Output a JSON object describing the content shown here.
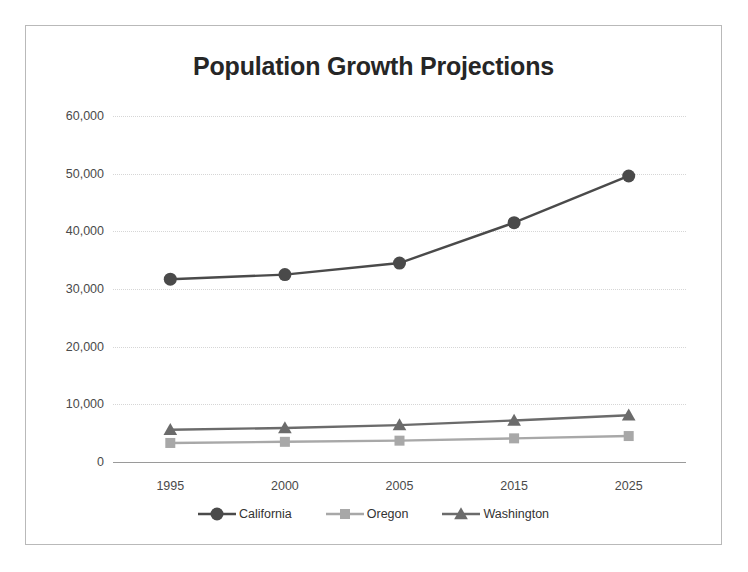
{
  "chart_data": {
    "type": "line",
    "title": "Population Growth Projections",
    "xlabel": "",
    "ylabel": "",
    "categories": [
      "1995",
      "2000",
      "2005",
      "2015",
      "2025"
    ],
    "series": [
      {
        "name": "California",
        "color": "#4a4a4a",
        "marker": "circle",
        "values": [
          31700,
          32500,
          34500,
          41500,
          49600
        ]
      },
      {
        "name": "Oregon",
        "color": "#a8a8a8",
        "marker": "square",
        "values": [
          3300,
          3500,
          3700,
          4100,
          4500
        ]
      },
      {
        "name": "Washington",
        "color": "#6b6b6b",
        "marker": "triangle",
        "values": [
          5600,
          5900,
          6400,
          7200,
          8100
        ]
      }
    ],
    "ylim": [
      0,
      60000
    ],
    "ytick_values": [
      0,
      10000,
      20000,
      30000,
      40000,
      50000,
      60000
    ],
    "ytick_labels": [
      "0",
      "10,000",
      "20,000",
      "30,000",
      "40,000",
      "50,000",
      "60,000"
    ],
    "grid": true,
    "legend_position": "bottom"
  }
}
